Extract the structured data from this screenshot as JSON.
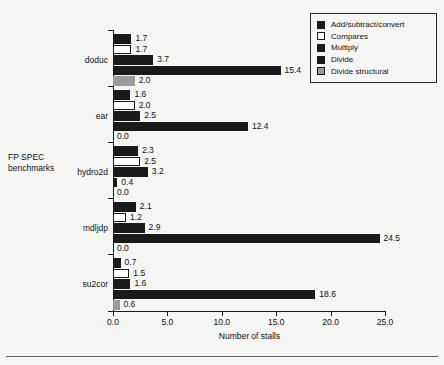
{
  "chart_data": {
    "type": "bar",
    "orientation": "horizontal",
    "title": "",
    "xlabel": "Number of stalls",
    "ylabel": "FP SPEC\nbenchmarks",
    "ylabel_line1": "FP SPEC",
    "ylabel_line2": "benchmarks",
    "xlim": [
      0.0,
      25.0
    ],
    "xticks": [
      "0.0",
      "5.0",
      "10.0",
      "15.0",
      "20.0",
      "25.0"
    ],
    "xtick_values": [
      0.0,
      5.0,
      10.0,
      15.0,
      20.0,
      25.0
    ],
    "grid": false,
    "legend_position": "top-right",
    "categories": [
      "doduc",
      "ear",
      "hydro2d",
      "mdljdp",
      "su2cor"
    ],
    "series": [
      {
        "name": "Add/subtract/convert",
        "color": "#1a1a1a",
        "values": [
          1.7,
          1.6,
          2.3,
          2.1,
          0.7
        ],
        "labels": [
          "1.7",
          "1.6",
          "2.3",
          "2.1",
          "0.7"
        ]
      },
      {
        "name": "Compares",
        "color": "#ffffff",
        "values": [
          1.7,
          2.0,
          2.5,
          1.2,
          1.5
        ],
        "labels": [
          "1.7",
          "2.0",
          "2.5",
          "1.2",
          "1.5"
        ]
      },
      {
        "name": "Multiply",
        "color": "#1a1a1a",
        "values": [
          3.7,
          2.5,
          3.2,
          2.9,
          1.6
        ],
        "labels": [
          "3.7",
          "2.5",
          "3.2",
          "2.9",
          "1.6"
        ]
      },
      {
        "name": "Divide",
        "color": "#1a1a1a",
        "values": [
          15.4,
          12.4,
          0.4,
          24.5,
          18.6
        ],
        "labels": [
          "15.4",
          "12.4",
          "0.4",
          "24.5",
          "18.6"
        ]
      },
      {
        "name": "Divide structural",
        "color": "#9b9b9b",
        "values": [
          2.0,
          0.0,
          0.0,
          0.0,
          0.6
        ],
        "labels": [
          "2.0",
          "0.0",
          "0.0",
          "0.0",
          "0.6"
        ]
      }
    ]
  },
  "legend": {
    "items": [
      {
        "label": "Add/subtract/convert",
        "color": "#1a1a1a"
      },
      {
        "label": "Compares",
        "color": "#ffffff"
      },
      {
        "label": "Multiply",
        "color": "#1a1a1a"
      },
      {
        "label": "Divide",
        "color": "#1a1a1a"
      },
      {
        "label": "Divide structural",
        "color": "#9b9b9b"
      }
    ]
  },
  "axes": {
    "x_label": "Number of stalls",
    "y_label_line1": "FP SPEC",
    "y_label_line2": "benchmarks",
    "x_ticks": [
      "0.0",
      "5.0",
      "10.0",
      "15.0",
      "20.0",
      "25.0"
    ]
  }
}
